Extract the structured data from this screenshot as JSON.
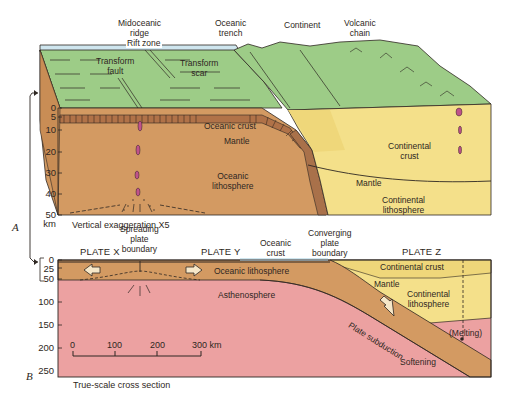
{
  "panel_a": {
    "id_label": "A",
    "top_labels": {
      "ridge": "Midoceanic\nridge",
      "rift": "Rift zone",
      "trench": "Oceanic\ntrench",
      "continent": "Continent",
      "volcanic": "Volcanic\nchain"
    },
    "surface_labels": {
      "transform_fault": "Transform\nfault",
      "transform_scar": "Transform\nscar"
    },
    "section_labels": {
      "oceanic_crust": "Oceanic crust",
      "mantle": "Mantle",
      "oceanic_lithosphere": "Oceanic\nlithosphere",
      "continental_crust": "Continental\ncrust",
      "mantle_right": "Mantle",
      "continental_lithosphere": "Continental\nlithosphere"
    },
    "depth_axis": {
      "ticks": [
        "0",
        "5",
        "10",
        "20",
        "30",
        "40",
        "50"
      ],
      "unit": "km"
    },
    "caption": "Vertical exaggeration X5"
  },
  "panel_b": {
    "id_label": "B",
    "plates": [
      "PLATE X",
      "PLATE Y",
      "PLATE Z"
    ],
    "boundary_labels": {
      "spreading": "Spreading\nplate\nboundary",
      "oceanic_crust": "Oceanic\ncrust",
      "converging": "Converging\nplate\nboundary"
    },
    "section_labels": {
      "oceanic_lithosphere": "Oceanic lithosphere",
      "asthenosphere": "Asthenosphere",
      "continental_crust": "Continental crust",
      "mantle": "Mantle",
      "continental_lithosphere": "Continental\nlithosphere",
      "plate_subduction": "Plate subduction",
      "melting": "(Melting)",
      "softening": "Softening"
    },
    "depth_axis": {
      "ticks": [
        "0",
        "25",
        "50",
        "100",
        "150",
        "200",
        "250"
      ]
    },
    "scale_bar": {
      "ticks": [
        "0",
        "100",
        "200",
        "300 km"
      ]
    },
    "caption": "True-scale cross section"
  },
  "colors": {
    "surface_green": "#9dcc87",
    "ocean_blue": "#cfe6ef",
    "oceanic_lith": "#d39a62",
    "continental": "#f4e08a",
    "asthenosphere": "#eca1a1",
    "magma": "#c0528a",
    "ink": "#2e2722"
  }
}
